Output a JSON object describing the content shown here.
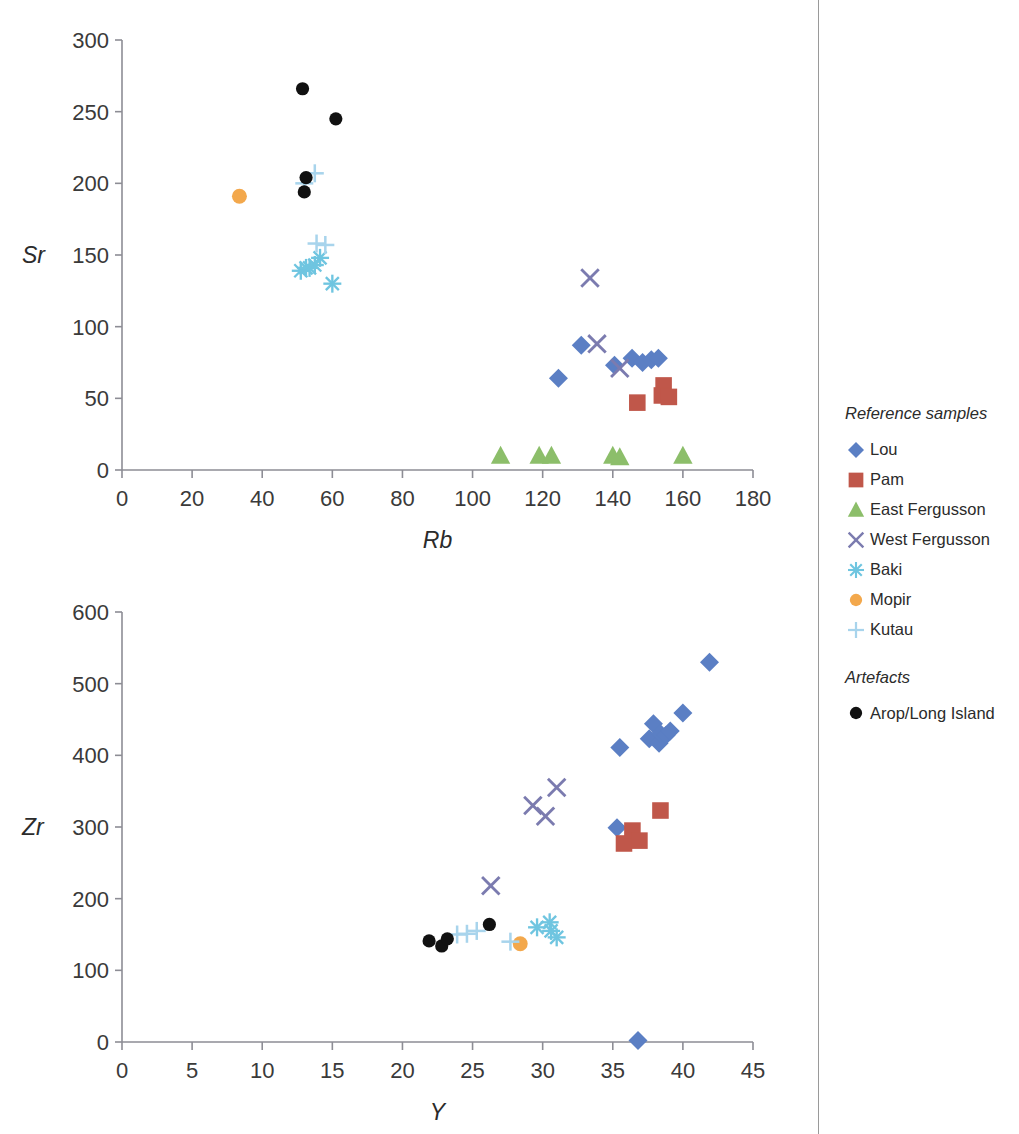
{
  "figure": {
    "divider_color": "#9a9a9a"
  },
  "legend": {
    "heading_reference": "Reference samples",
    "heading_artefacts": "Artefacts",
    "reference_items": [
      {
        "label": "Lou",
        "marker": "diamond",
        "color": "#5B7FC4",
        "icon": "blue-diamond-icon"
      },
      {
        "label": "Pam",
        "marker": "square",
        "color": "#C0574A",
        "icon": "red-square-icon"
      },
      {
        "label": "East Fergusson",
        "marker": "triangle",
        "color": "#8CBE6A",
        "icon": "green-triangle-icon"
      },
      {
        "label": "West Fergusson",
        "marker": "x",
        "color": "#7B7BAF",
        "icon": "purple-x-icon"
      },
      {
        "label": "Baki",
        "marker": "asterisk",
        "color": "#6FC5E0",
        "icon": "cyan-asterisk-icon"
      },
      {
        "label": "Mopir",
        "marker": "circle",
        "color": "#F3A84C",
        "icon": "orange-circle-icon"
      },
      {
        "label": "Kutau",
        "marker": "plus",
        "color": "#A8D4EC",
        "icon": "paleblue-plus-icon"
      }
    ],
    "artefact_items": [
      {
        "label": "Arop/Long Island",
        "marker": "circle",
        "color": "#111111",
        "icon": "black-circle-icon"
      }
    ]
  },
  "chart_data": [
    {
      "id": "sr-vs-rb",
      "type": "scatter",
      "title": "",
      "xlabel": "Rb",
      "ylabel": "Sr",
      "xlim": [
        0,
        180
      ],
      "ylim": [
        0,
        300
      ],
      "xticks": [
        0,
        20,
        40,
        60,
        80,
        100,
        120,
        140,
        160,
        180
      ],
      "yticks": [
        0,
        50,
        100,
        150,
        200,
        250,
        300
      ],
      "grid": false,
      "legend_position": "right-external",
      "series": [
        {
          "name": "Lou",
          "marker": "diamond",
          "color": "#5B7FC4",
          "points": [
            [
              124.5,
              64
            ],
            [
              131,
              87
            ],
            [
              140.5,
              73
            ],
            [
              145.5,
              78
            ],
            [
              148.5,
              75
            ],
            [
              151,
              77
            ],
            [
              153,
              78
            ]
          ]
        },
        {
          "name": "Pam",
          "marker": "square",
          "color": "#C0574A",
          "points": [
            [
              147,
              47
            ],
            [
              154.5,
              59
            ],
            [
              154,
              52
            ],
            [
              156,
              51
            ]
          ]
        },
        {
          "name": "East Fergusson",
          "marker": "triangle",
          "color": "#8CBE6A",
          "points": [
            [
              108,
              10
            ],
            [
              119,
              10
            ],
            [
              122.5,
              10
            ],
            [
              140,
              10
            ],
            [
              142,
              9
            ],
            [
              160,
              10
            ]
          ]
        },
        {
          "name": "West Fergusson",
          "marker": "x",
          "color": "#7B7BAF",
          "points": [
            [
              133.5,
              134
            ],
            [
              135.5,
              88
            ],
            [
              142,
              71
            ]
          ]
        },
        {
          "name": "Baki",
          "marker": "asterisk",
          "color": "#6FC5E0",
          "points": [
            [
              51,
              139
            ],
            [
              52.5,
              141
            ],
            [
              53.5,
              141
            ],
            [
              55,
              143
            ],
            [
              56.5,
              148
            ],
            [
              60,
              130
            ]
          ]
        },
        {
          "name": "Mopir",
          "marker": "circle",
          "color": "#F3A84C",
          "points": [
            [
              33.5,
              191
            ]
          ]
        },
        {
          "name": "Kutau",
          "marker": "plus",
          "color": "#A8D4EC",
          "points": [
            [
              52,
              200
            ],
            [
              55,
              207
            ],
            [
              55.5,
              158
            ],
            [
              58,
              157
            ]
          ]
        },
        {
          "name": "Arop/Long Island",
          "marker": "circle",
          "color": "#111111",
          "points": [
            [
              51.5,
              266
            ],
            [
              61,
              245
            ],
            [
              52.5,
              204
            ],
            [
              52,
              194
            ]
          ]
        }
      ]
    },
    {
      "id": "zr-vs-y",
      "type": "scatter",
      "title": "",
      "xlabel": "Y",
      "ylabel": "Zr",
      "xlim": [
        0,
        45
      ],
      "ylim": [
        0,
        600
      ],
      "xticks": [
        0,
        5,
        10,
        15,
        20,
        25,
        30,
        35,
        40,
        45
      ],
      "yticks": [
        0,
        100,
        200,
        300,
        400,
        500,
        600
      ],
      "grid": false,
      "legend_position": "right-external",
      "series": [
        {
          "name": "Lou",
          "marker": "diamond",
          "color": "#5B7FC4",
          "points": [
            [
              35.3,
              299
            ],
            [
              35.5,
              411
            ],
            [
              37.6,
              423
            ],
            [
              37.9,
              444
            ],
            [
              38.3,
              417
            ],
            [
              38.4,
              430
            ],
            [
              38.8,
              428
            ],
            [
              39.1,
              434
            ],
            [
              40.0,
              459
            ],
            [
              41.9,
              530
            ],
            [
              36.8,
              2
            ]
          ]
        },
        {
          "name": "Pam",
          "marker": "square",
          "color": "#C0574A",
          "points": [
            [
              35.8,
              277
            ],
            [
              36.4,
              295
            ],
            [
              36.9,
              281
            ],
            [
              38.4,
              323
            ]
          ]
        },
        {
          "name": "West Fergusson",
          "marker": "x",
          "color": "#7B7BAF",
          "points": [
            [
              26.3,
              218
            ],
            [
              29.3,
              330
            ],
            [
              30.2,
              315
            ],
            [
              31.0,
              355
            ]
          ]
        },
        {
          "name": "Baki",
          "marker": "asterisk",
          "color": "#6FC5E0",
          "points": [
            [
              29.6,
              160
            ],
            [
              30.5,
              167
            ],
            [
              30.6,
              155
            ],
            [
              31.0,
              146
            ]
          ]
        },
        {
          "name": "Mopir",
          "marker": "circle",
          "color": "#F3A84C",
          "points": [
            [
              28.4,
              137
            ]
          ]
        },
        {
          "name": "Kutau",
          "marker": "plus",
          "color": "#A8D4EC",
          "points": [
            [
              23.9,
              150
            ],
            [
              24.6,
              151
            ],
            [
              25.3,
              155
            ],
            [
              27.7,
              140
            ]
          ]
        },
        {
          "name": "Arop/Long Island",
          "marker": "circle",
          "color": "#111111",
          "points": [
            [
              21.9,
              141
            ],
            [
              22.8,
              134
            ],
            [
              23.2,
              144
            ],
            [
              26.2,
              164
            ]
          ]
        }
      ]
    }
  ]
}
